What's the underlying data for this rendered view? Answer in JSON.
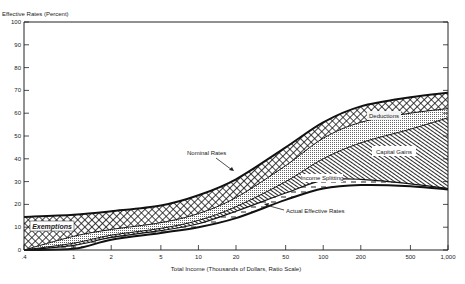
{
  "chart_data": {
    "type": "area",
    "title": "",
    "ylabel": "Effective Rates (Percent)",
    "xlabel": "Total Income (Thousands of Dollars, Ratio Scale)",
    "x_scale": "log",
    "x": [
      0.4,
      1,
      2,
      5,
      10,
      20,
      50,
      100,
      200,
      500,
      1000
    ],
    "x_tick_labels": [
      ".4",
      "1",
      "2",
      "5",
      "10",
      "20",
      "50",
      "100",
      "200",
      "500",
      "1,000"
    ],
    "y_ticks": [
      0,
      10,
      20,
      30,
      40,
      50,
      60,
      70,
      80,
      90,
      100
    ],
    "ylim": [
      0,
      100
    ],
    "grid": false,
    "boundaries": [
      {
        "name": "Nominal Rates",
        "values": [
          14.5,
          15.5,
          17,
          19.5,
          24,
          31,
          45,
          56,
          63,
          67,
          69
        ]
      },
      {
        "name": "Nominal less exemptions",
        "values": [
          0,
          6,
          9,
          12,
          16,
          23,
          37,
          49,
          56,
          60,
          62
        ]
      },
      {
        "name": "After deductions",
        "values": [
          0,
          3,
          6.5,
          9.5,
          13,
          19,
          30,
          40,
          47,
          53,
          58
        ]
      },
      {
        "name": "After capital gains",
        "values": [
          0,
          2,
          5.5,
          8.5,
          11.5,
          17,
          25,
          30.5,
          31,
          29,
          27
        ]
      },
      {
        "name": "Actual Effective Rates",
        "values": [
          0,
          0.5,
          4.5,
          7.5,
          10,
          14,
          22,
          27,
          28.5,
          28,
          26.5
        ]
      }
    ],
    "series": [
      {
        "name": "Exemptions",
        "pattern": "cross-hatch"
      },
      {
        "name": "Deductions",
        "pattern": "dots"
      },
      {
        "name": "Capital Gains",
        "pattern": "diagonal"
      },
      {
        "name": "Income Splitting",
        "pattern": "dashes"
      }
    ],
    "annotations": [
      "Nominal Rates",
      "Deductions",
      "Capital Gains",
      "Income Splitting",
      "Actual Effective Rates",
      "Exemptions"
    ]
  },
  "labels": {
    "ylabel": "Effective Rates (Percent)",
    "xlabel": "Total Income (Thousands of Dollars, Ratio Scale)",
    "nominal": "Nominal Rates",
    "deductions": "Deductions",
    "capital_gains": "Capital Gains",
    "income_splitting": "Income Splitting",
    "actual": "Actual Effective Rates",
    "exemptions": "Exemptions"
  }
}
